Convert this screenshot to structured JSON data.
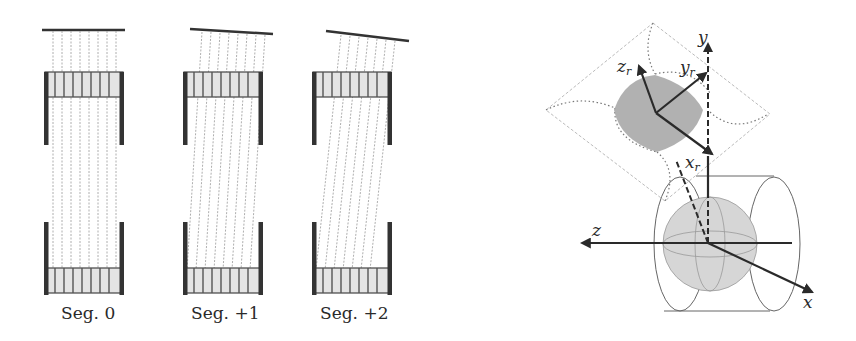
{
  "figure": {
    "left_panel": {
      "description": "Collimator segments with parallel/tilted septa projecting to a detector bar",
      "segments": [
        {
          "label": "Seg. 0",
          "tilt_deg": 0
        },
        {
          "label": "Seg. +1",
          "tilt_deg": 4
        },
        {
          "label": "Seg. +2",
          "tilt_deg": 8
        }
      ]
    },
    "right_panel": {
      "description": "Rotated coordinate frame on a curved plane above a sphere inside a cylinder",
      "axes": {
        "global": {
          "x": "x",
          "y": "y",
          "z": "z"
        },
        "rotated": {
          "x_base": "x",
          "y_base": "y",
          "z_base": "z",
          "subscript": "r"
        }
      }
    },
    "colors": {
      "ink": "#2a2a2a",
      "rail": "#333333",
      "gray_fill": "#a8a8a8",
      "sphere_fill": "#d6d6d6",
      "dotted": "#777777"
    }
  }
}
